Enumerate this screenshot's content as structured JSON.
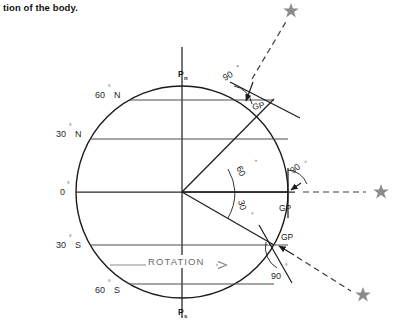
{
  "caption": {
    "text": "tion of the body."
  },
  "figure": {
    "colors": {
      "outline": "#1a1a1a",
      "gridline": "#4d4d4d",
      "rotation_arrow": "#8a8a8a",
      "star": "#8c8c8c",
      "dashed_ray": "#3a3a3a",
      "background": "#ffffff"
    },
    "poles": {
      "north": {
        "label": "P",
        "sub": "n"
      },
      "south": {
        "label": "P",
        "sub": "s"
      }
    },
    "latitude_labels": [
      {
        "id": "lat-60n",
        "text": "60",
        "deg": "°",
        "hemi": "N"
      },
      {
        "id": "lat-30n",
        "text": "30",
        "deg": "°",
        "hemi": "N"
      },
      {
        "id": "lat-0",
        "text": "0",
        "deg": "°",
        "hemi": ""
      },
      {
        "id": "lat-30s",
        "text": "30",
        "deg": "°",
        "hemi": "S"
      },
      {
        "id": "lat-60s",
        "text": "60",
        "deg": "°",
        "hemi": "S"
      }
    ],
    "rotation": {
      "label": "ROTATION",
      "direction": "eastward"
    },
    "interior_angles": [
      {
        "id": "angle-60",
        "text": "60",
        "deg": "°"
      },
      {
        "id": "angle-30",
        "text": "30",
        "deg": "°"
      }
    ],
    "exterior_angles": [
      {
        "id": "angle-90-upper",
        "text": "90",
        "deg": "°"
      },
      {
        "id": "angle-90-middle",
        "text": "90",
        "deg": "°"
      },
      {
        "id": "angle-90-lower",
        "text": "90",
        "deg": "°"
      }
    ],
    "gp_labels": [
      {
        "id": "gp-upper",
        "text": "GP"
      },
      {
        "id": "gp-middle",
        "text": "GP"
      },
      {
        "id": "gp-lower",
        "text": "GP"
      }
    ],
    "stars": [
      {
        "id": "star-upper",
        "glyph": "star-icon"
      },
      {
        "id": "star-middle",
        "glyph": "star-icon"
      },
      {
        "id": "star-lower",
        "glyph": "star-icon"
      }
    ]
  }
}
